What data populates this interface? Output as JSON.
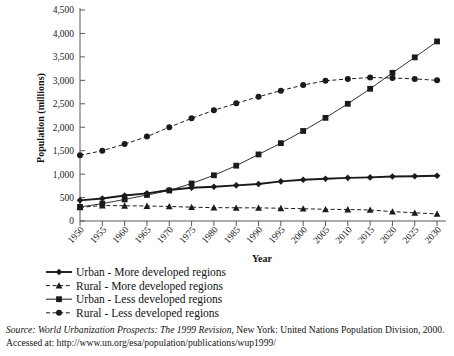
{
  "chart_data": {
    "type": "line",
    "title": "",
    "xlabel": "Year",
    "ylabel": "Population (millions)",
    "x": [
      1950,
      1955,
      1960,
      1965,
      1970,
      1975,
      1980,
      1985,
      1990,
      1995,
      2000,
      2005,
      2010,
      2015,
      2020,
      2025,
      2030
    ],
    "xtick_labels": [
      "1950",
      "1955",
      "1960",
      "1965",
      "1970",
      "1975",
      "1980",
      "1985",
      "1990",
      "1995",
      "2000",
      "2005",
      "2010",
      "2015",
      "2020",
      "2025",
      "2030"
    ],
    "ytick_labels": [
      "0",
      "500",
      "1,000",
      "1,500",
      "2,000",
      "2,500",
      "3,000",
      "3,500",
      "4,000",
      "4,500"
    ],
    "ytick_values": [
      0,
      500,
      1000,
      1500,
      2000,
      2500,
      3000,
      3500,
      4000,
      4500
    ],
    "xlim": [
      1950,
      2032
    ],
    "ylim": [
      0,
      4500
    ],
    "grid": false,
    "legend_position": "below-plot",
    "series": [
      {
        "name": "Urban - More developed regions",
        "marker": "diamond",
        "line_style": "solid",
        "color": "#1b1b1b",
        "values": [
          440,
          480,
          545,
          590,
          660,
          710,
          730,
          760,
          790,
          845,
          880,
          900,
          920,
          930,
          950,
          955,
          965
        ]
      },
      {
        "name": "Rural - More developed regions",
        "marker": "triangle",
        "line_style": "dashed",
        "color": "#1b1b1b",
        "values": [
          290,
          330,
          325,
          320,
          310,
          295,
          285,
          282,
          280,
          272,
          262,
          250,
          245,
          235,
          200,
          175,
          150
        ]
      },
      {
        "name": "Urban - Less developed regions",
        "marker": "square",
        "line_style": "solid",
        "color": "#1b1b1b",
        "values": [
          300,
          370,
          460,
          555,
          650,
          800,
          975,
          1180,
          1420,
          1660,
          1920,
          2200,
          2500,
          2820,
          3160,
          3490,
          3830
        ]
      },
      {
        "name": "Rural - Less developed regions",
        "marker": "circle",
        "line_style": "dashed",
        "color": "#1b1b1b",
        "values": [
          1400,
          1500,
          1640,
          1800,
          2000,
          2190,
          2360,
          2510,
          2650,
          2780,
          2900,
          2990,
          3030,
          3060,
          3050,
          3030,
          3000
        ]
      }
    ]
  },
  "source": {
    "lead": "Source:",
    "title": " World Urbanization Prospects: The 1999 Revision",
    "rest": ", New York: United Nations Population Division, 2000. Accessed at: http://www.un.org/esa/population/publications/wup1999/"
  }
}
